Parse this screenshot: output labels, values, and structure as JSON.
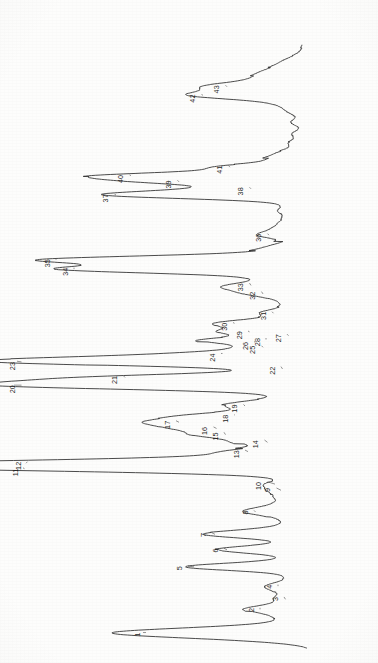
{
  "figure": {
    "kind": "gas-chromatogram",
    "orientation": "rotated-90-clockwise",
    "background_color": "#fdfdfc",
    "trace_color": "#2b2b2b",
    "label_color": "#1d1d1d",
    "baseline_axis_x": 312,
    "time_axis_start_y": 648,
    "time_axis_end_y": 45,
    "peak_count": 43
  },
  "chart_data": {
    "type": "line",
    "title": "",
    "subtitle": "",
    "xlabel": "",
    "ylabel": "",
    "xlim": [
      0,
      100
    ],
    "ylim": [
      0,
      100
    ],
    "grid": false,
    "legend": null,
    "annotations": "Numbered peak labels 1-43 with leader lines",
    "series": [
      {
        "name": "Total ion chromatogram",
        "x_is_retention_time": true,
        "peaks": [
          {
            "label": "1",
            "rt": 2.0,
            "height": 56.0,
            "width": 0.55,
            "label_rt": 2.0,
            "label_offset": 58.0
          },
          {
            "label": "2",
            "rt": 5.0,
            "height": 17.0,
            "width": 0.45,
            "label_rt": 5.2,
            "label_offset": 20.0
          },
          {
            "label": "3",
            "rt": 6.3,
            "height": 8.5,
            "width": 0.42,
            "label_rt": 6.6,
            "label_offset": 12.0
          },
          {
            "label": "4",
            "rt": 8.0,
            "height": 11.0,
            "width": 0.42,
            "label_rt": 8.2,
            "label_offset": 14.0
          },
          {
            "label": "5",
            "rt": 10.5,
            "height": 39.0,
            "width": 0.45,
            "label_rt": 10.6,
            "label_offset": 44.0
          },
          {
            "label": "6",
            "rt": 12.7,
            "height": 28.0,
            "width": 0.45,
            "label_rt": 12.9,
            "label_offset": 32.0
          },
          {
            "label": "7",
            "rt": 14.7,
            "height": 32.0,
            "width": 0.45,
            "label_rt": 14.9,
            "label_offset": 36.0
          },
          {
            "label": "8",
            "rt": 17.6,
            "height": 18.5,
            "width": 0.45,
            "label_rt": 17.8,
            "label_offset": 22.0
          },
          {
            "label": "9",
            "rt": 20.4,
            "height": 10.0,
            "width": 0.4,
            "label_rt": 20.7,
            "label_offset": 14.5
          },
          {
            "label": "10",
            "rt": 21.2,
            "height": 12.0,
            "width": 0.42,
            "label_rt": 21.5,
            "label_offset": 17.5
          },
          {
            "label": "11",
            "rt": 23.3,
            "height": 96.0,
            "width": 0.5,
            "label_rt": 23.2,
            "label_offset": 98.5
          },
          {
            "label": "12",
            "rt": 23.9,
            "height": 95.0,
            "width": 0.5,
            "label_rt": 24.1,
            "label_offset": 97.5
          },
          {
            "label": "13",
            "rt": 25.4,
            "height": 21.0,
            "width": 0.42,
            "label_rt": 25.6,
            "label_offset": 25.0
          },
          {
            "label": "14",
            "rt": 26.6,
            "height": 14.5,
            "width": 0.4,
            "label_rt": 26.9,
            "label_offset": 18.5
          },
          {
            "label": "15",
            "rt": 27.6,
            "height": 28.5,
            "width": 0.42,
            "label_rt": 27.9,
            "label_offset": 32.0
          },
          {
            "label": "16",
            "rt": 28.4,
            "height": 31.5,
            "width": 0.42,
            "label_rt": 28.6,
            "label_offset": 35.5
          },
          {
            "label": "17",
            "rt": 29.2,
            "height": 44.0,
            "width": 0.45,
            "label_rt": 29.4,
            "label_offset": 48.0
          },
          {
            "label": "18",
            "rt": 30.1,
            "height": 25.5,
            "width": 0.42,
            "label_rt": 30.2,
            "label_offset": 28.5
          },
          {
            "label": "19",
            "rt": 31.3,
            "height": 22.0,
            "width": 0.45,
            "label_rt": 31.5,
            "label_offset": 25.5
          },
          {
            "label": "20",
            "rt": 34.0,
            "height": 99.0,
            "width": 0.52,
            "label_rt": 34.0,
            "label_offset": 99.5
          },
          {
            "label": "21",
            "rt": 35.0,
            "height": 62.0,
            "width": 0.48,
            "label_rt": 35.2,
            "label_offset": 65.5
          },
          {
            "label": "22",
            "rt": 36.1,
            "height": 9.5,
            "width": 0.4,
            "label_rt": 36.4,
            "label_offset": 13.0
          },
          {
            "label": "23",
            "rt": 37.1,
            "height": 98.0,
            "width": 0.5,
            "label_rt": 37.0,
            "label_offset": 99.5
          },
          {
            "label": "24",
            "rt": 38.1,
            "height": 29.5,
            "width": 0.42,
            "label_rt": 38.1,
            "label_offset": 33.0
          },
          {
            "label": "25",
            "rt": 38.9,
            "height": 16.0,
            "width": 0.38,
            "label_rt": 39.1,
            "label_offset": 19.5
          },
          {
            "label": "26",
            "rt": 39.6,
            "height": 18.5,
            "width": 0.38,
            "label_rt": 39.6,
            "label_offset": 22.0
          },
          {
            "label": "27",
            "rt": 40.4,
            "height": 7.5,
            "width": 0.38,
            "label_rt": 40.6,
            "label_offset": 11.0
          },
          {
            "label": "28",
            "rt": 39.9,
            "height": 15.0,
            "width": 0.36,
            "label_rt": 40.1,
            "label_offset": 18.0
          },
          {
            "label": "29",
            "rt": 40.9,
            "height": 20.5,
            "width": 0.38,
            "label_rt": 41.0,
            "label_offset": 24.0
          },
          {
            "label": "30",
            "rt": 42.0,
            "height": 25.5,
            "width": 0.42,
            "label_rt": 42.1,
            "label_offset": 29.0
          },
          {
            "label": "31",
            "rt": 43.3,
            "height": 12.5,
            "width": 0.38,
            "label_rt": 43.5,
            "label_offset": 16.0
          },
          {
            "label": "32",
            "rt": 45.8,
            "height": 16.0,
            "width": 0.4,
            "label_rt": 46.1,
            "label_offset": 19.5
          },
          {
            "label": "33",
            "rt": 46.9,
            "height": 20.0,
            "width": 0.4,
            "label_rt": 47.2,
            "label_offset": 23.5
          },
          {
            "label": "34",
            "rt": 49.0,
            "height": 79.0,
            "width": 0.48,
            "label_rt": 49.2,
            "label_offset": 82.0
          },
          {
            "label": "35",
            "rt": 50.2,
            "height": 85.0,
            "width": 0.48,
            "label_rt": 50.3,
            "label_offset": 88.0
          },
          {
            "label": "36",
            "rt": 53.4,
            "height": 14.0,
            "width": 0.4,
            "label_rt": 53.6,
            "label_offset": 17.5
          },
          {
            "label": "37",
            "rt": 58.6,
            "height": 65.0,
            "width": 0.48,
            "label_rt": 58.7,
            "label_offset": 68.5
          },
          {
            "label": "38",
            "rt": 59.4,
            "height": 20.0,
            "width": 0.4,
            "label_rt": 59.6,
            "label_offset": 23.5
          },
          {
            "label": "39",
            "rt": 60.3,
            "height": 44.0,
            "width": 0.45,
            "label_rt": 60.5,
            "label_offset": 47.5
          },
          {
            "label": "40",
            "rt": 61.1,
            "height": 60.0,
            "width": 0.45,
            "label_rt": 61.2,
            "label_offset": 63.5
          },
          {
            "label": "41",
            "rt": 62.2,
            "height": 27.0,
            "width": 0.42,
            "label_rt": 62.4,
            "label_offset": 30.5
          },
          {
            "label": "42",
            "rt": 71.5,
            "height": 36.0,
            "width": 0.5,
            "label_rt": 71.6,
            "label_offset": 39.5
          },
          {
            "label": "43",
            "rt": 72.6,
            "height": 28.0,
            "width": 0.5,
            "label_rt": 72.8,
            "label_offset": 31.5
          }
        ],
        "unlabeled_peaks": [
          {
            "rt": 1.1,
            "height": 12.0,
            "width": 0.55
          },
          {
            "rt": 1.5,
            "height": 7.0,
            "width": 0.5
          },
          {
            "rt": 2.7,
            "height": 9.0,
            "width": 0.45
          },
          {
            "rt": 3.3,
            "height": 5.5,
            "width": 0.45
          },
          {
            "rt": 3.9,
            "height": 6.5,
            "width": 0.45
          },
          {
            "rt": 4.4,
            "height": 4.5,
            "width": 0.4
          },
          {
            "rt": 5.6,
            "height": 5.0,
            "width": 0.4
          },
          {
            "rt": 6.9,
            "height": 4.5,
            "width": 0.4
          },
          {
            "rt": 7.4,
            "height": 5.5,
            "width": 0.4
          },
          {
            "rt": 8.6,
            "height": 4.0,
            "width": 0.4
          },
          {
            "rt": 9.2,
            "height": 5.0,
            "width": 0.4
          },
          {
            "rt": 9.8,
            "height": 3.5,
            "width": 0.4
          },
          {
            "rt": 11.3,
            "height": 6.0,
            "width": 0.4
          },
          {
            "rt": 11.9,
            "height": 4.0,
            "width": 0.4
          },
          {
            "rt": 13.4,
            "height": 5.0,
            "width": 0.4
          },
          {
            "rt": 14.0,
            "height": 4.0,
            "width": 0.4
          },
          {
            "rt": 15.4,
            "height": 7.5,
            "width": 0.4
          },
          {
            "rt": 16.0,
            "height": 5.0,
            "width": 0.4
          },
          {
            "rt": 16.7,
            "height": 6.5,
            "width": 0.4
          },
          {
            "rt": 18.3,
            "height": 7.5,
            "width": 0.4
          },
          {
            "rt": 18.9,
            "height": 6.0,
            "width": 0.4
          },
          {
            "rt": 19.6,
            "height": 8.5,
            "width": 0.4
          },
          {
            "rt": 22.1,
            "height": 6.5,
            "width": 0.4
          },
          {
            "rt": 22.6,
            "height": 5.0,
            "width": 0.4
          },
          {
            "rt": 24.6,
            "height": 9.5,
            "width": 0.4
          },
          {
            "rt": 25.0,
            "height": 6.0,
            "width": 0.4
          },
          {
            "rt": 26.0,
            "height": 5.5,
            "width": 0.4
          },
          {
            "rt": 27.1,
            "height": 6.5,
            "width": 0.4
          },
          {
            "rt": 29.8,
            "height": 8.0,
            "width": 0.4
          },
          {
            "rt": 30.6,
            "height": 7.0,
            "width": 0.4
          },
          {
            "rt": 31.9,
            "height": 9.0,
            "width": 0.4
          },
          {
            "rt": 32.5,
            "height": 6.0,
            "width": 0.4
          },
          {
            "rt": 33.1,
            "height": 4.5,
            "width": 0.4
          },
          {
            "rt": 36.7,
            "height": 5.5,
            "width": 0.4
          },
          {
            "rt": 37.6,
            "height": 7.0,
            "width": 0.35
          },
          {
            "rt": 41.4,
            "height": 9.5,
            "width": 0.38
          },
          {
            "rt": 42.6,
            "height": 7.0,
            "width": 0.38
          },
          {
            "rt": 43.9,
            "height": 6.0,
            "width": 0.38
          },
          {
            "rt": 44.5,
            "height": 5.0,
            "width": 0.38
          },
          {
            "rt": 45.1,
            "height": 7.0,
            "width": 0.38
          },
          {
            "rt": 46.4,
            "height": 13.0,
            "width": 0.38
          },
          {
            "rt": 47.6,
            "height": 11.5,
            "width": 0.38
          },
          {
            "rt": 48.2,
            "height": 9.0,
            "width": 0.38
          },
          {
            "rt": 50.9,
            "height": 8.0,
            "width": 0.4
          },
          {
            "rt": 51.6,
            "height": 10.5,
            "width": 0.4
          },
          {
            "rt": 52.3,
            "height": 7.0,
            "width": 0.4
          },
          {
            "rt": 54.2,
            "height": 9.0,
            "width": 0.4
          },
          {
            "rt": 55.0,
            "height": 7.5,
            "width": 0.4
          },
          {
            "rt": 55.8,
            "height": 6.0,
            "width": 0.4
          },
          {
            "rt": 56.6,
            "height": 8.0,
            "width": 0.4
          },
          {
            "rt": 57.4,
            "height": 6.0,
            "width": 0.4
          },
          {
            "rt": 63.2,
            "height": 10.0,
            "width": 0.45
          },
          {
            "rt": 64.1,
            "height": 7.0,
            "width": 0.45
          },
          {
            "rt": 65.3,
            "height": 5.0,
            "width": 0.45
          },
          {
            "rt": 66.5,
            "height": 4.0,
            "width": 0.45
          },
          {
            "rt": 68.0,
            "height": 4.5,
            "width": 0.45
          },
          {
            "rt": 69.4,
            "height": 5.0,
            "width": 0.5
          },
          {
            "rt": 70.4,
            "height": 7.5,
            "width": 0.5
          },
          {
            "rt": 73.6,
            "height": 13.0,
            "width": 0.6
          },
          {
            "rt": 74.6,
            "height": 9.0,
            "width": 0.6
          },
          {
            "rt": 75.8,
            "height": 6.0,
            "width": 0.7
          }
        ],
        "baseline_drift": [
          {
            "rt": 0.0,
            "level": 0.0
          },
          {
            "rt": 10.0,
            "level": 1.2
          },
          {
            "rt": 22.0,
            "level": 1.8
          },
          {
            "rt": 34.0,
            "level": 1.4
          },
          {
            "rt": 46.0,
            "level": 1.0
          },
          {
            "rt": 58.0,
            "level": 1.6
          },
          {
            "rt": 70.0,
            "level": 2.4
          },
          {
            "rt": 78.0,
            "level": 3.0
          }
        ]
      }
    ]
  },
  "labels": {
    "all": [
      "1",
      "2",
      "3",
      "4",
      "5",
      "6",
      "7",
      "8",
      "9",
      "10",
      "11",
      "12",
      "13",
      "14",
      "15",
      "16",
      "17",
      "18",
      "19",
      "20",
      "21",
      "22",
      "23",
      "24",
      "25",
      "26",
      "27",
      "28",
      "29",
      "30",
      "31",
      "32",
      "33",
      "34",
      "35",
      "36",
      "37",
      "38",
      "39",
      "40",
      "41",
      "42",
      "43"
    ]
  }
}
